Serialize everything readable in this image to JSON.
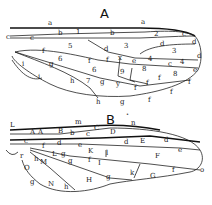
{
  "figure": {
    "wing_a": {
      "caption": "A",
      "labels": [
        "a",
        "a",
        "b",
        "1",
        "b",
        "2",
        "c",
        "c",
        "c",
        "d",
        "3",
        "d",
        "3",
        "d",
        "d",
        "5",
        "f",
        "6",
        "f",
        "f",
        "x",
        "e",
        "4",
        "c",
        "4",
        "e",
        "8",
        "8",
        "9",
        "6",
        "g",
        "h",
        "7",
        "g",
        "y",
        "f",
        "f",
        "f",
        "f",
        "f",
        "h",
        "g",
        "f",
        "i",
        "i"
      ]
    },
    "wing_b": {
      "caption": "B",
      "dot": "•",
      "labels": [
        "L",
        "m",
        "n",
        "A",
        "A",
        "B",
        "b",
        "c",
        "C",
        "D",
        "c",
        "d",
        "E",
        "d",
        "e",
        "d",
        "e",
        "K",
        "f",
        "l",
        "F",
        "L",
        "g",
        "g",
        "f",
        "I",
        "M",
        "h",
        "r",
        "O",
        "g",
        "N",
        "h",
        "H",
        "g",
        "k",
        "G",
        "f",
        "o"
      ]
    }
  }
}
